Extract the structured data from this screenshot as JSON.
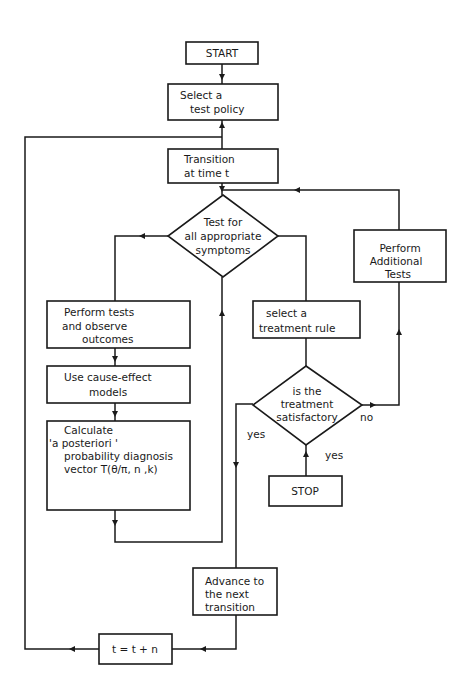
{
  "flowchart": {
    "start": {
      "label": "START"
    },
    "select_test_policy": {
      "lines": [
        "Select a",
        "test  policy"
      ]
    },
    "transition": {
      "lines": [
        "Transition",
        "at time t"
      ]
    },
    "test_symptoms": {
      "lines": [
        "Test  for",
        "all  appropriate",
        "symptoms"
      ]
    },
    "perform_tests": {
      "lines": [
        "Perform  tests",
        "and  observe",
        "outcomes"
      ]
    },
    "cause_effect": {
      "lines": [
        "Use  cause-effect",
        "models"
      ]
    },
    "calculate": {
      "lines": [
        "Calculate",
        "'a  posteriori '",
        "probability   diagnosis",
        "vector   T(θ/π, n ,k)"
      ]
    },
    "select_treatment": {
      "lines": [
        "select  a",
        "treatment  rule"
      ]
    },
    "additional_tests": {
      "lines": [
        "Perform",
        "Additional",
        "Tests"
      ]
    },
    "treatment_ok": {
      "lines": [
        "is  the",
        "treatment",
        "satisfactory"
      ]
    },
    "stop": {
      "label": "STOP"
    },
    "advance": {
      "lines": [
        "Advance to",
        "the  next",
        "transition"
      ]
    },
    "increment": {
      "label": "t = t + n"
    },
    "edge_labels": {
      "yes_left": "yes",
      "yes_down": "yes",
      "no_right": "no"
    }
  }
}
